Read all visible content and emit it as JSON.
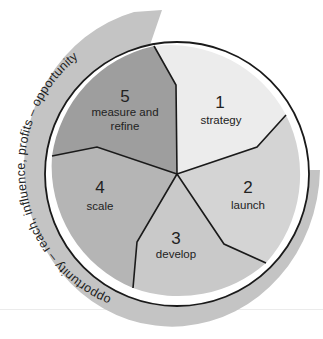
{
  "diagram": {
    "type": "cycle-wheel",
    "outer_band_text": "opportunity – reach, influence, profits – opportunity",
    "segments": [
      {
        "number": "1",
        "label_line1": "strategy",
        "label_line2": "",
        "color": "#ececec"
      },
      {
        "number": "2",
        "label_line1": "launch",
        "label_line2": "",
        "color": "#d4d4d4"
      },
      {
        "number": "3",
        "label_line1": "develop",
        "label_line2": "",
        "color": "#c9c9c9"
      },
      {
        "number": "4",
        "label_line1": "scale",
        "label_line2": "",
        "color": "#b5b5b5"
      },
      {
        "number": "5",
        "label_line1": "measure and",
        "label_line2": "refine",
        "color": "#9e9e9e"
      }
    ],
    "colors": {
      "band": "#c4c4c4",
      "outline": "#1a1a1a",
      "text": "#222222"
    }
  }
}
